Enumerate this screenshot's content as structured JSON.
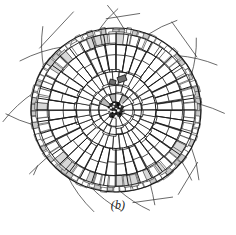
{
  "figure": {
    "caption": "(b)",
    "background_color": "#ffffff",
    "ink_color": "#1a1a1a"
  },
  "specimen": {
    "center_x": 116,
    "center_y": 110,
    "outer_radius_x": 85,
    "outer_radius_y": 82,
    "layers": [
      {
        "name": "root-hairs",
        "inner_r": 0.98,
        "outer_r": 1.28,
        "count": 17
      },
      {
        "name": "epidermis",
        "inner_r": 0.93,
        "outer_r": 1.0,
        "count": 82
      },
      {
        "name": "outer-cortex",
        "inner_r": 0.8,
        "outer_r": 0.94,
        "count": 64
      },
      {
        "name": "radial-cortex",
        "inner_r": 0.47,
        "outer_r": 0.8,
        "count": 40
      },
      {
        "name": "inner-cortex",
        "inner_r": 0.3,
        "outer_r": 0.48,
        "count": 34
      },
      {
        "name": "pericycle",
        "inner_r": 0.2,
        "outer_r": 0.31,
        "count": 24
      },
      {
        "name": "stele-parenchyma",
        "inner_r": 0.09,
        "outer_r": 0.21,
        "count": 16
      },
      {
        "name": "xylem-core",
        "inner_r": 0.0,
        "outer_r": 0.1,
        "count": 1
      }
    ],
    "dark_patches": [
      {
        "x": 0.07,
        "y": -0.38,
        "w": 0.1,
        "h": 0.07
      },
      {
        "x": -0.04,
        "y": -0.34,
        "w": 0.07,
        "h": 0.06
      }
    ]
  },
  "chart_data": {
    "type": "scatter",
    "title": "(b)",
    "xlabel": "",
    "ylabel": "",
    "series": [
      {
        "name": "root-hairs",
        "values": [
          17
        ]
      },
      {
        "name": "epidermis-cells",
        "values": [
          82
        ]
      },
      {
        "name": "outer-cortex",
        "values": [
          64
        ]
      },
      {
        "name": "radial-cortex",
        "values": [
          40
        ]
      },
      {
        "name": "inner-cortex",
        "values": [
          34
        ]
      },
      {
        "name": "pericycle",
        "values": [
          24
        ]
      },
      {
        "name": "stele-parenchyma",
        "values": [
          16
        ]
      }
    ]
  }
}
